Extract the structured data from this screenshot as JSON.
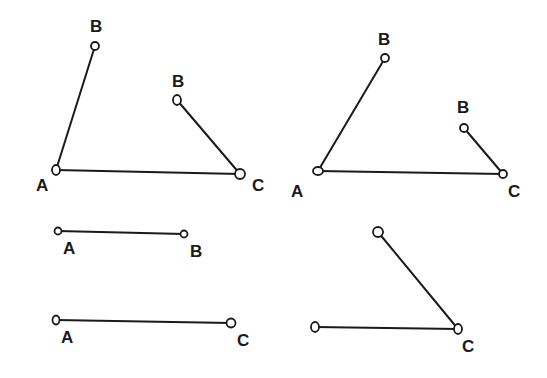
{
  "colors": {
    "ink": "#1a1a1a",
    "background": "#ffffff"
  },
  "figures": [
    {
      "name": "triangle-left",
      "segments": [
        {
          "x1": 56,
          "y1": 170,
          "x2": 95,
          "y2": 46
        },
        {
          "x1": 56,
          "y1": 170,
          "x2": 240,
          "y2": 174
        },
        {
          "x1": 177,
          "y1": 100,
          "x2": 240,
          "y2": 174
        }
      ],
      "points": [
        {
          "cx": 95,
          "cy": 46,
          "rx": 4,
          "ry": 4
        },
        {
          "cx": 177,
          "cy": 100,
          "rx": 4,
          "ry": 5
        },
        {
          "cx": 56,
          "cy": 170,
          "rx": 4,
          "ry": 5
        },
        {
          "cx": 240,
          "cy": 174,
          "rx": 5,
          "ry": 5
        }
      ],
      "labels": [
        {
          "text": "B",
          "x": 90,
          "y": 32
        },
        {
          "text": "B",
          "x": 172,
          "y": 87
        },
        {
          "text": "A",
          "x": 36,
          "y": 191
        },
        {
          "text": "C",
          "x": 252,
          "y": 191
        }
      ]
    },
    {
      "name": "triangle-right",
      "segments": [
        {
          "x1": 318,
          "y1": 171,
          "x2": 385,
          "y2": 58
        },
        {
          "x1": 318,
          "y1": 171,
          "x2": 503,
          "y2": 174
        },
        {
          "x1": 464,
          "y1": 128,
          "x2": 503,
          "y2": 174
        }
      ],
      "points": [
        {
          "cx": 385,
          "cy": 58,
          "rx": 4,
          "ry": 4
        },
        {
          "cx": 464,
          "cy": 128,
          "rx": 4,
          "ry": 4
        },
        {
          "cx": 318,
          "cy": 171,
          "rx": 5,
          "ry": 4
        },
        {
          "cx": 503,
          "cy": 174,
          "rx": 4,
          "ry": 4
        }
      ],
      "labels": [
        {
          "text": "B",
          "x": 378,
          "y": 45
        },
        {
          "text": "B",
          "x": 457,
          "y": 113
        },
        {
          "text": "A",
          "x": 291,
          "y": 197
        },
        {
          "text": "C",
          "x": 508,
          "y": 197
        }
      ]
    },
    {
      "name": "segment-ab",
      "segments": [
        {
          "x1": 58,
          "y1": 231,
          "x2": 184,
          "y2": 234
        }
      ],
      "points": [
        {
          "cx": 58,
          "cy": 231,
          "rx": 3.5,
          "ry": 3.5
        },
        {
          "cx": 184,
          "cy": 234,
          "rx": 3.5,
          "ry": 3.5
        }
      ],
      "labels": [
        {
          "text": "A",
          "x": 63,
          "y": 254
        },
        {
          "text": "B",
          "x": 190,
          "y": 257
        }
      ]
    },
    {
      "name": "segment-ac",
      "segments": [
        {
          "x1": 56,
          "y1": 320,
          "x2": 231,
          "y2": 323
        }
      ],
      "points": [
        {
          "cx": 56,
          "cy": 320,
          "rx": 3.5,
          "ry": 4.5
        },
        {
          "cx": 231,
          "cy": 323,
          "rx": 4.5,
          "ry": 4.5
        }
      ],
      "labels": [
        {
          "text": "A",
          "x": 61,
          "y": 343
        },
        {
          "text": "C",
          "x": 237,
          "y": 346
        }
      ]
    },
    {
      "name": "angle-c",
      "segments": [
        {
          "x1": 378,
          "y1": 232,
          "x2": 458,
          "y2": 329
        },
        {
          "x1": 315,
          "y1": 327,
          "x2": 458,
          "y2": 329
        }
      ],
      "points": [
        {
          "cx": 378,
          "cy": 232,
          "rx": 5,
          "ry": 5
        },
        {
          "cx": 315,
          "cy": 327,
          "rx": 4,
          "ry": 5
        },
        {
          "cx": 458,
          "cy": 329,
          "rx": 4,
          "ry": 5
        }
      ],
      "labels": [
        {
          "text": "C",
          "x": 462,
          "y": 352
        }
      ]
    }
  ]
}
